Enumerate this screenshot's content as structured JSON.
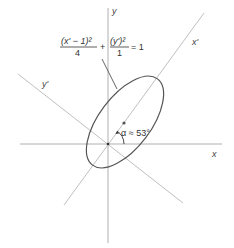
{
  "diagram": {
    "type": "rotated-ellipse",
    "axes": {
      "x_label": "x",
      "y_label": "y",
      "x_prime_label": "x'",
      "y_prime_label": "y'"
    },
    "equation": {
      "term1_numerator": "(x' − 1)²",
      "term1_denominator": "4",
      "plus": "+",
      "term2_numerator": "(y')²",
      "term2_denominator": "1",
      "equals": "= 1"
    },
    "angle_label": "α ≈ 53°",
    "rotation_degrees": 53,
    "colors": {
      "axis": "#aaaaaa",
      "ellipse": "#555555",
      "text": "#333333"
    }
  }
}
